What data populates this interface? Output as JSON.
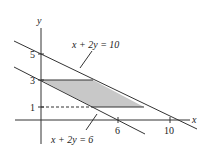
{
  "diagram": {
    "axes": {
      "x_label": "x",
      "y_label": "y",
      "x_ticks": [
        {
          "value": 6,
          "label": "6"
        },
        {
          "value": 10,
          "label": "10"
        }
      ],
      "y_ticks": [
        {
          "value": 1,
          "label": "1"
        },
        {
          "value": 3,
          "label": "3"
        },
        {
          "value": 5,
          "label": "5"
        }
      ]
    },
    "lines": [
      {
        "equation": "x + 2y = 10",
        "label": "x + 2y = 10"
      },
      {
        "equation": "x + 2y = 6",
        "label": "x + 2y = 6"
      }
    ],
    "region": {
      "description": "Shaded parallelogram bounded by y=1, y=3, x+2y=6, x+2y=10",
      "vertices": [
        [
          0,
          3
        ],
        [
          4,
          3
        ],
        [
          8,
          1
        ],
        [
          4,
          1
        ]
      ],
      "fill": "#c8c8c8"
    },
    "dashed_guide": {
      "from": [
        0,
        1
      ],
      "to": [
        4,
        1
      ]
    },
    "colors": {
      "stroke": "#333333",
      "shade": "#c8c8c8"
    }
  }
}
